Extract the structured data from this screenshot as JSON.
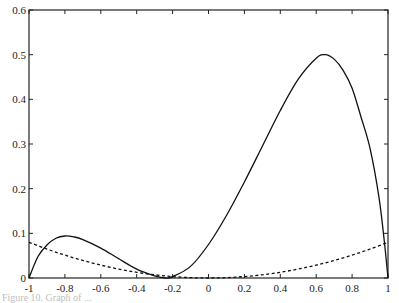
{
  "chart_data": {
    "type": "line",
    "title": "",
    "xlabel": "",
    "ylabel": "",
    "xlim": [
      -1,
      1
    ],
    "ylim": [
      0,
      0.6
    ],
    "grid": false,
    "legend": null,
    "x_ticks": [
      -1,
      -0.8,
      -0.6,
      -0.4,
      -0.2,
      0,
      0.2,
      0.4,
      0.6,
      0.8,
      1
    ],
    "x_tick_labels": [
      "-1",
      "-0.8",
      "-0.6",
      "-0.4",
      "-0.2",
      "0",
      "0.2",
      "0.4",
      "0.6",
      "0.8",
      "1"
    ],
    "y_ticks": [
      0,
      0.1,
      0.2,
      0.3,
      0.4,
      0.5,
      0.6
    ],
    "y_tick_labels": [
      "0",
      "0.1",
      "0.2",
      "0.3",
      "0.4",
      "0.5",
      "0.6"
    ],
    "series": [
      {
        "name": "solid curve",
        "style": "solid",
        "color": "#111111",
        "x": [
          -1,
          -0.95,
          -0.9,
          -0.85,
          -0.8,
          -0.75,
          -0.7,
          -0.6,
          -0.5,
          -0.4,
          -0.3,
          -0.24,
          -0.2,
          -0.1,
          0,
          0.1,
          0.2,
          0.3,
          0.4,
          0.5,
          0.6,
          0.65,
          0.7,
          0.75,
          0.8,
          0.85,
          0.9,
          0.95,
          0.98,
          1
        ],
        "y": [
          0,
          0.048,
          0.074,
          0.089,
          0.094,
          0.092,
          0.086,
          0.067,
          0.043,
          0.02,
          0.005,
          0,
          0.003,
          0.026,
          0.075,
          0.14,
          0.215,
          0.295,
          0.375,
          0.445,
          0.492,
          0.5,
          0.49,
          0.465,
          0.425,
          0.36,
          0.29,
          0.18,
          0.08,
          0
        ]
      },
      {
        "name": "dashed curve",
        "style": "dashed",
        "color": "#111111",
        "x": [
          -1,
          -0.9,
          -0.8,
          -0.7,
          -0.6,
          -0.5,
          -0.4,
          -0.3,
          -0.2,
          -0.1,
          0,
          0.1,
          0.2,
          0.3,
          0.4,
          0.5,
          0.6,
          0.7,
          0.8,
          0.9,
          1
        ],
        "y": [
          0.08,
          0.0648,
          0.0512,
          0.0392,
          0.0288,
          0.02,
          0.0128,
          0.0072,
          0.0032,
          0.0008,
          0,
          0.0008,
          0.0032,
          0.0072,
          0.0128,
          0.02,
          0.0288,
          0.0392,
          0.0512,
          0.0648,
          0.08
        ]
      }
    ],
    "annotations": []
  },
  "caption": {
    "text": "Figure 10.  Graph of ..."
  }
}
